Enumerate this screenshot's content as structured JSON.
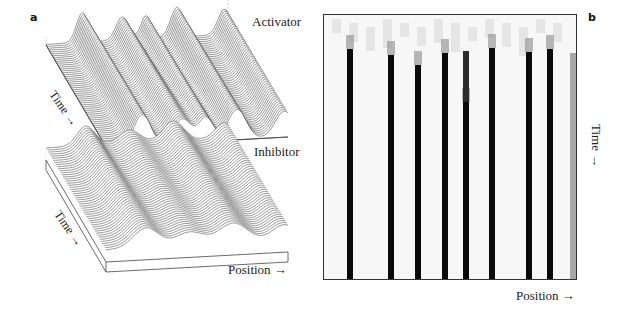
{
  "figure": {
    "panel_a": {
      "letter": "a",
      "activator_label": "Activator",
      "inhibitor_label": "Inhibitor",
      "time_label": "Time →",
      "position_label": "Position →",
      "activator_surface": {
        "peaks": [
          {
            "pos": 0.2,
            "height": 1.0,
            "width": 0.045
          },
          {
            "pos": 0.42,
            "height": 0.78,
            "width": 0.05
          },
          {
            "pos": 0.55,
            "height": 0.78,
            "width": 0.04
          },
          {
            "pos": 0.72,
            "height": 1.0,
            "width": 0.05
          },
          {
            "pos": 0.98,
            "height": 0.85,
            "width": 0.05
          }
        ],
        "line_color": "#333333"
      },
      "inhibitor_surface": {
        "peaks": [
          {
            "pos": 0.22,
            "height": 0.9,
            "width": 0.07
          },
          {
            "pos": 0.46,
            "height": 0.6,
            "width": 0.08
          },
          {
            "pos": 0.7,
            "height": 0.9,
            "width": 0.08
          },
          {
            "pos": 0.98,
            "height": 0.7,
            "width": 0.07
          }
        ],
        "line_color": "#333333"
      }
    },
    "panel_b": {
      "letter": "b",
      "time_label": "Time →",
      "position_label": "Position →",
      "bars": [
        {
          "x": 23,
          "start": 34,
          "pre_start": 0
        },
        {
          "x": 64,
          "start": 40,
          "pre_start": 0
        },
        {
          "x": 91,
          "start": 50,
          "pre_start": 0
        },
        {
          "x": 118,
          "start": 38,
          "pre_start": 0
        },
        {
          "x": 139,
          "start": 87,
          "pre_start": 36
        },
        {
          "x": 165,
          "start": 33,
          "pre_start": 0
        },
        {
          "x": 202,
          "start": 37,
          "pre_start": 0
        },
        {
          "x": 223,
          "start": 34,
          "pre_start": 0
        }
      ],
      "bar_width": 6,
      "edge_strip_x": 246,
      "colors": {
        "bar": "#0a0a0a",
        "background": "#f7f7f7",
        "frame": "#333333"
      }
    }
  },
  "chart_data": {
    "type": "heatmap",
    "title": "",
    "panels": [
      {
        "id": "a",
        "kind": "3d-surface",
        "series": [
          "Activator",
          "Inhibitor"
        ],
        "xlabel": "Position",
        "ylabel": "Time",
        "activator_peak_positions": [
          0.2,
          0.42,
          0.55,
          0.72,
          0.98
        ],
        "inhibitor_peak_positions": [
          0.22,
          0.46,
          0.7,
          0.98
        ]
      },
      {
        "id": "b",
        "kind": "kymograph",
        "xlabel": "Position",
        "ylabel": "Time",
        "stripe_count": 8,
        "stripe_positions_relative": [
          0.09,
          0.25,
          0.36,
          0.46,
          0.55,
          0.65,
          0.8,
          0.88
        ]
      }
    ]
  }
}
